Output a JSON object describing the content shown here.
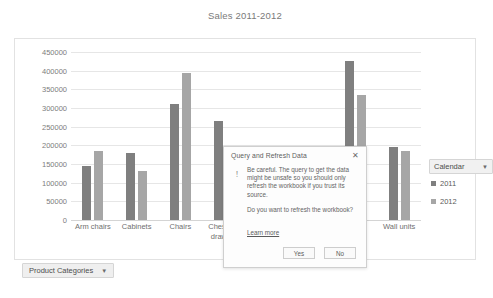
{
  "chart_data": {
    "type": "bar",
    "title": "Sales 2011-2012",
    "xlabel": "",
    "ylabel": "",
    "ylim": [
      0,
      450000
    ],
    "ytick_step": 50000,
    "yticks": [
      "450000",
      "400000",
      "350000",
      "300000",
      "250000",
      "200000",
      "150000",
      "100000",
      "50000",
      "0"
    ],
    "grid": true,
    "legend_position": "right",
    "categories": [
      "Arm chairs",
      "Cabinets",
      "Chairs",
      "Chests of drawers",
      "Desks",
      "Sofas",
      "Tables",
      "Wall units"
    ],
    "series": [
      {
        "name": "2011",
        "color": "#7f7f7f",
        "values": [
          145000,
          180000,
          310000,
          265000,
          190000,
          90000,
          425000,
          195000
        ]
      },
      {
        "name": "2012",
        "color": "#a6a6a6",
        "values": [
          185000,
          130000,
          395000,
          155000,
          120000,
          60000,
          335000,
          185000
        ]
      }
    ]
  },
  "slicers": {
    "calendar": {
      "label": "Calendar",
      "caret": "chevron-down-icon"
    },
    "product_categories": {
      "label": "Product Categories",
      "caret": "chevron-down-icon"
    }
  },
  "dialog": {
    "title": "Query and Refresh Data",
    "close_label": "✕",
    "warning_glyph": "!",
    "body_paragraph_1": "Be careful. The query to get the data might be unsafe so you should only refresh the workbook if you trust its source.",
    "body_paragraph_2": "Do you want to refresh the workbook?",
    "learn_more_label": "Learn more",
    "yes_label": "Yes",
    "no_label": "No"
  },
  "colors": {
    "series_2011": "#7f7f7f",
    "series_2012": "#a6a6a6",
    "grid": "#e6e6e6",
    "frame": "#e2e2e2",
    "text": "#6f6f6f"
  }
}
